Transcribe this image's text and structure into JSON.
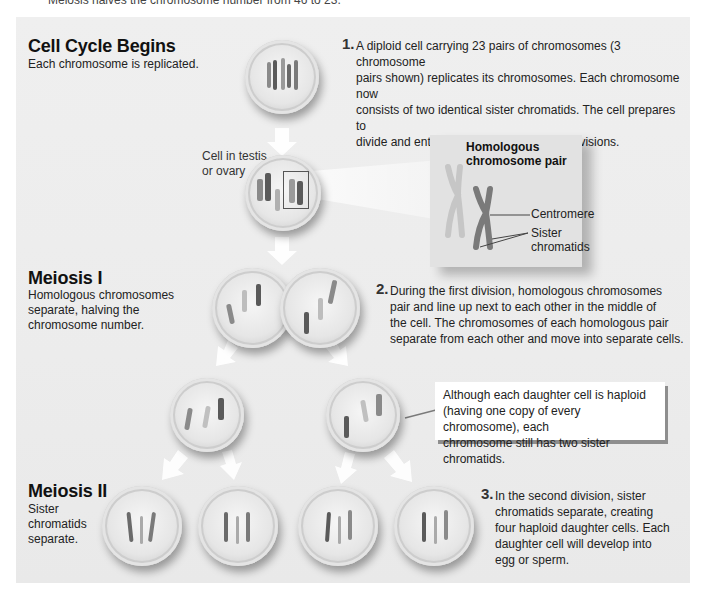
{
  "top_caption": "Meiosis halves the chromosome number from 46 to 23.",
  "sections": {
    "cell_cycle": {
      "heading": "Cell Cycle Begins",
      "subtitle": "Each chromosome is replicated."
    },
    "meiosis_1": {
      "heading": "Meiosis I",
      "subtitle_lines": [
        "Homologous chromosomes",
        "separate, halving the",
        "chromosome number."
      ]
    },
    "meiosis_2": {
      "heading": "Meiosis II",
      "subtitle_lines": [
        "Sister",
        "chromatids",
        "separate."
      ]
    }
  },
  "steps": [
    {
      "number": "1.",
      "lines": [
        "A diploid cell carrying 23 pairs of chromosomes (3 chromosome",
        "pairs shown) replicates its chromosomes. Each chromosome now",
        "consists of two identical sister chromatids. The cell prepares to",
        "divide and enters the first of two meiotic divisions."
      ]
    },
    {
      "number": "2.",
      "lines": [
        "During the first division, homologous chromosomes",
        "pair and line up next to each other in the middle of",
        "the cell. The chromosomes of each homologous pair",
        "separate from each other and move into separate cells."
      ]
    },
    {
      "number": "3.",
      "lines": [
        "In the second division, sister",
        "chromatids separate, creating",
        "four haploid daughter cells. Each",
        "daughter cell will develop into",
        "egg or sperm."
      ]
    }
  ],
  "cell_label": [
    "Cell in testis",
    "or ovary"
  ],
  "inset": {
    "title_lines": [
      "Homologous",
      "chromosome pair"
    ],
    "labels": {
      "centromere": "Centromere",
      "sister_chromatids": [
        "Sister",
        "chromatids"
      ]
    }
  },
  "callout": {
    "lines": [
      "Although each daughter cell is haploid",
      "(having one copy of every chromosome), each",
      "chromosome still has two sister chromatids."
    ]
  },
  "colors": {
    "panel_bg": "#ececec",
    "chromosome_dark": "#5a5a5a",
    "chromosome_mid": "#8a8a8a",
    "chromosome_light": "#b8b8b8",
    "arrow": "#ffffff"
  }
}
